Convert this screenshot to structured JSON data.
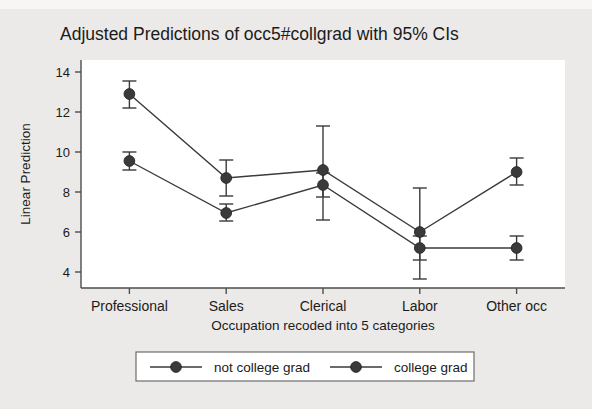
{
  "chart_data": {
    "type": "line",
    "title": "Adjusted Predictions of occ5#collgrad with 95% CIs",
    "xlabel": "Occupation recoded into 5 categories",
    "ylabel": "Linear Prediction",
    "categories": [
      "Professional",
      "Sales",
      "Clerical",
      "Labor",
      "Other occ"
    ],
    "ylim": [
      3.2,
      14.6
    ],
    "yticks": [
      4,
      6,
      8,
      10,
      12,
      14
    ],
    "yticklabels": [
      "4",
      "6",
      "8",
      "10",
      "12",
      "14"
    ],
    "grid": false,
    "legend_position": "bottom",
    "series": [
      {
        "name": "not college grad",
        "color": "#3a3a3a",
        "values": [
          9.55,
          6.95,
          8.35,
          5.2,
          5.2
        ],
        "ci_low": [
          9.1,
          6.55,
          7.75,
          4.6,
          4.6
        ],
        "ci_high": [
          10.0,
          7.4,
          8.95,
          5.8,
          5.8
        ]
      },
      {
        "name": "college grad",
        "color": "#3a3a3a",
        "values": [
          12.9,
          8.7,
          9.1,
          6.0,
          9.0
        ],
        "ci_low": [
          12.2,
          7.8,
          6.6,
          3.65,
          8.35
        ],
        "ci_high": [
          13.55,
          9.6,
          11.3,
          8.2,
          9.7
        ]
      }
    ]
  },
  "legend": {
    "items": [
      {
        "label": "not college grad"
      },
      {
        "label": "college grad"
      }
    ]
  },
  "colors": {
    "figure_background": "#eceae8",
    "plot_background": "#ffffff",
    "axis": "#4d4d4d",
    "marker": "#3a3a3a"
  }
}
